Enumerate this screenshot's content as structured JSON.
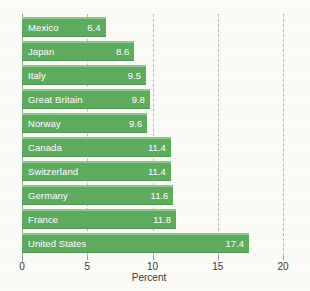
{
  "chart_data": {
    "type": "bar",
    "orientation": "horizontal",
    "title": "",
    "subtitle": "",
    "categories": [
      "Mexico",
      "Japan",
      "Italy",
      "Great Britain",
      "Norway",
      "Canada",
      "Switzerland",
      "Germany",
      "France",
      "United States"
    ],
    "values": [
      6.4,
      8.6,
      9.5,
      9.8,
      9.6,
      11.4,
      11.4,
      11.6,
      11.8,
      17.4
    ],
    "value_labels": [
      "6.4",
      "8.6",
      "9.5",
      "9.8",
      "9.6",
      "11.4",
      "11.4",
      "11.6",
      "11.8",
      "17.4"
    ],
    "xlabel": "Percent",
    "ylabel": "",
    "xlim": [
      0,
      20
    ],
    "xticks": [
      0,
      5,
      10,
      15,
      20
    ],
    "xtick_labels": [
      "0",
      "5",
      "10",
      "15",
      "20"
    ],
    "grid": true,
    "grid_axis": "x",
    "grid_style": "dashed",
    "legend": false,
    "bar_color": "#5fab5f",
    "bar_highlight_color": "#8fc88f",
    "label_color": "#ffffff",
    "axis_color": "#9a9a9a",
    "background": "#fbfbf8"
  },
  "axis": {
    "xlabel": "Percent",
    "ticks": [
      {
        "value": 0,
        "label": "0"
      },
      {
        "value": 5,
        "label": "5"
      },
      {
        "value": 10,
        "label": "10"
      },
      {
        "value": 15,
        "label": "15"
      },
      {
        "value": 20,
        "label": "20"
      }
    ]
  },
  "header": {
    "title_fragment": ""
  }
}
